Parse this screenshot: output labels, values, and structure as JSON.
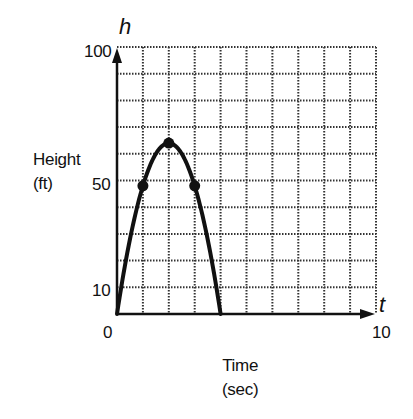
{
  "chart_data": {
    "type": "line",
    "title": "",
    "xlabel": "Time (sec)",
    "ylabel": "Height (ft)",
    "x_axis_var": "t",
    "y_axis_var": "h",
    "xlim": [
      0,
      10
    ],
    "ylim": [
      0,
      100
    ],
    "x_tick_labels": [
      "0",
      "10"
    ],
    "y_tick_labels": [
      "10",
      "50",
      "100"
    ],
    "grid": true,
    "grid_style": "dotted",
    "grid_x_step": 1,
    "grid_y_step": 10,
    "series": [
      {
        "name": "h(t) = -16t^2 + 64t",
        "x": [
          0,
          0.5,
          1,
          1.5,
          2,
          2.5,
          3,
          3.5,
          4
        ],
        "y": [
          0,
          28,
          48,
          60,
          64,
          60,
          48,
          28,
          0
        ]
      }
    ],
    "marked_points": [
      {
        "x": 1,
        "y": 48
      },
      {
        "x": 2,
        "y": 64
      },
      {
        "x": 3,
        "y": 48
      }
    ],
    "legend": null
  },
  "labels": {
    "y_var": "h",
    "x_var": "t",
    "y_title_line1": "Height",
    "y_title_line2": "(ft)",
    "x_title_line1": "Time",
    "x_title_line2": "(sec)",
    "y_tick_100": "100",
    "y_tick_50": "50",
    "y_tick_10": "10",
    "x_tick_0": "0",
    "x_tick_10": "10"
  },
  "colors": {
    "ink": "#111111",
    "grid": "#333333",
    "background": "#ffffff"
  }
}
